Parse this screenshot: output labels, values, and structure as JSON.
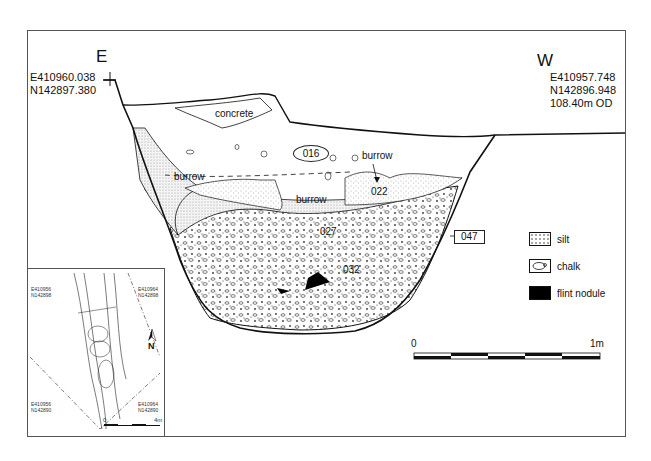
{
  "section": {
    "east": {
      "direction": "E",
      "easting": "E410960.038",
      "northing": "N142897.380"
    },
    "west": {
      "direction": "W",
      "easting": "E410957.748",
      "northing": "N142896.948",
      "elevation": "108.40m OD"
    },
    "contexts": {
      "concrete": "concrete",
      "c016": "016",
      "burrow_left": "burrow",
      "burrow_center": "burrow",
      "burrow_right": "burrow",
      "c022": "022",
      "c027": "027",
      "c032": "032",
      "c047": "047"
    }
  },
  "legend": {
    "items": [
      {
        "swatch": "silt-pattern",
        "label": "silt"
      },
      {
        "swatch": "chalk-pattern",
        "label": "chalk"
      },
      {
        "swatch": "flint-nodule-fill",
        "label": "flint nodule"
      }
    ]
  },
  "scale_bar": {
    "start": "0",
    "end": "1m",
    "segments": 5
  },
  "inset_map": {
    "corners": {
      "top_left": {
        "easting": "E410956",
        "northing": "N142898"
      },
      "top_right": {
        "easting": "E410964",
        "northing": "N142898"
      },
      "bottom_left": {
        "easting": "E410956",
        "northing": "N142890"
      },
      "bottom_right": {
        "easting": "E410964",
        "northing": "N142890"
      }
    },
    "north_label": "N",
    "scale_start": "0",
    "scale_end": "4m"
  }
}
